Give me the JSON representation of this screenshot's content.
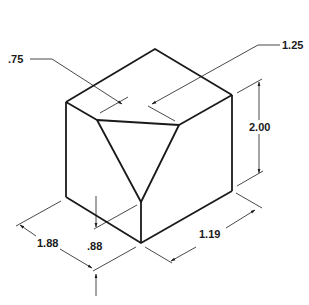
{
  "figure": {
    "type": "isometric-dimensioned-drawing",
    "dimensions": {
      "top_left_depth": ".75",
      "top_right_depth": "1.25",
      "height": "2.00",
      "left_width": "1.88",
      "cut_height": ".88",
      "right_width": "1.19"
    }
  },
  "colors": {
    "stroke": "#1a1a1a",
    "background": "#ffffff"
  }
}
